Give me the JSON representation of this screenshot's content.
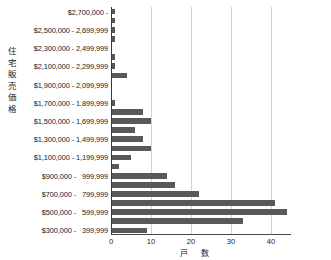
{
  "chart_data": {
    "type": "bar",
    "orientation": "horizontal",
    "title": "",
    "xlabel": "戸　数",
    "ylabel": "住宅販売価格",
    "xlim": [
      0,
      45
    ],
    "ylim": null,
    "grid": true,
    "legend": null,
    "bar_color": "#595959",
    "xticks": [
      "0",
      "10",
      "20",
      "30",
      "40"
    ],
    "xtick_values": [
      0,
      10,
      20,
      30,
      40
    ],
    "categories": [
      "$2,700,000 -",
      "$2,600,000 - 2,699,999",
      "$2,500,000 - 2,599,999",
      "$2,400,000 - 2,499,999",
      "$2,300,000 - 2,399,999",
      "$2,200,000 - 2,299,999",
      "$2,100,000 - 2,199,999",
      "$2,000,000 - 2,099,999",
      "$1,900,000 - 1,999,999",
      "$1,800,000 - 1,899,999",
      "$1,700,000 - 1,799,999",
      "$1,600,000 - 1,699,999",
      "$1,500,000 - 1,599,999",
      "$1,400,000 - 1,499,999",
      "$1,300,000 - 1,399,999",
      "$1,200,000 - 1,299,999",
      "$1,100,000 - 1,199,999",
      "$1,000,000 - 1,099,999",
      "$900,000 -   999,999",
      "$800,000 -   899,999",
      "$700,000 -   799,999",
      "$600,000 -   699,999",
      "$500,000 -   599,999",
      "$400,000 -   499,999",
      "$300,000 -   399,999"
    ],
    "values": [
      1,
      1,
      1,
      1,
      0,
      1,
      1,
      4,
      0,
      0,
      1,
      8,
      10,
      6,
      8,
      10,
      5,
      2,
      14,
      16,
      22,
      41,
      44,
      33,
      9
    ],
    "visible_tick_labels": [
      "$2,700,000 -",
      "$2,500,000 - 2,699,999",
      "$2,300,000 - 2,499,999",
      "$2,100,000 - 2,299,999",
      "$1,900,000 - 2,099,999",
      "$1,700,000 - 1,899,999",
      "$1,500,000 - 1,699,999",
      "$1,300,000 - 1,499,999",
      "$1,100,000 - 1,199,999",
      "$900,000 -   999,999",
      "$700,000 -   799,999",
      "$500,000 -   599,999",
      "$300,000 -   399,999"
    ]
  },
  "y_axis_title_chars": [
    "住",
    "宅",
    "販",
    "売",
    "価",
    "格"
  ]
}
